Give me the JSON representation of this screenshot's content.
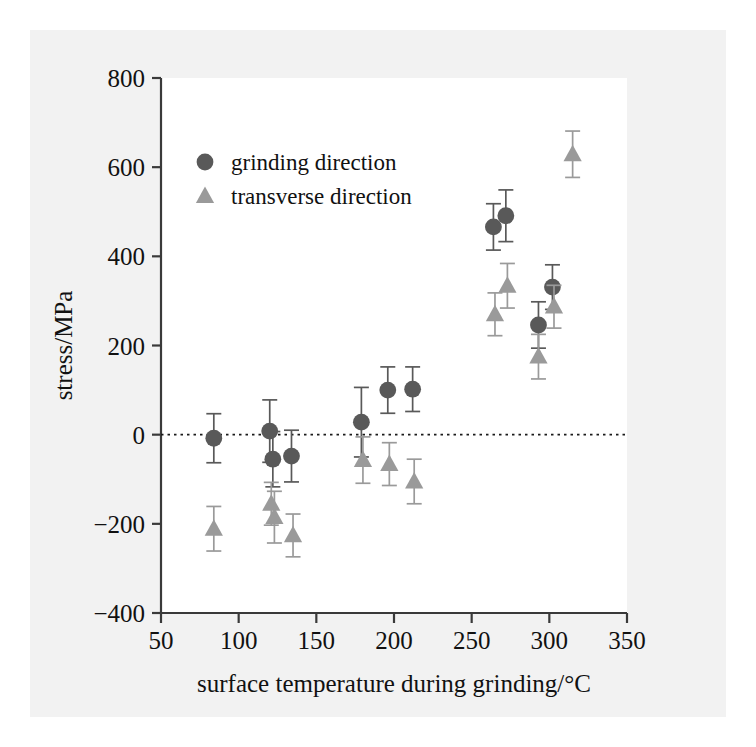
{
  "figure": {
    "background": "#f2f2f2",
    "plot_background": "#ffffff"
  },
  "chart_data": {
    "type": "scatter",
    "title": "",
    "xlabel": "surface temperature during grinding/°C",
    "ylabel": "stress/MPa",
    "xlim": [
      50,
      350
    ],
    "ylim": [
      -400,
      800
    ],
    "xticks": [
      50,
      100,
      150,
      200,
      250,
      300,
      350
    ],
    "yticks": [
      -400,
      -200,
      0,
      200,
      400,
      600,
      800
    ],
    "xtick_labels": [
      "50",
      "100",
      "150",
      "200",
      "250",
      "300",
      "350"
    ],
    "ytick_labels": [
      "−400",
      "−200",
      "0",
      "200",
      "400",
      "600",
      "800"
    ],
    "grid": false,
    "zero_reference_line": {
      "y": 0,
      "style": "dotted",
      "color": "#1a1a1a"
    },
    "legend": {
      "position": "upper left inside",
      "entries": [
        {
          "label": "grinding direction",
          "marker": "circle",
          "color": "#595959"
        },
        {
          "label": "transverse direction",
          "marker": "triangle",
          "color": "#9a9a9a"
        }
      ]
    },
    "series": [
      {
        "name": "grinding direction",
        "marker": "circle",
        "color": "#595959",
        "points": [
          {
            "x": 84,
            "y": -8,
            "yerr": 55
          },
          {
            "x": 120,
            "y": 8,
            "yerr": 70
          },
          {
            "x": 122,
            "y": -55,
            "yerr": 62
          },
          {
            "x": 134,
            "y": -48,
            "yerr": 58
          },
          {
            "x": 179,
            "y": 28,
            "yerr": 78
          },
          {
            "x": 196,
            "y": 100,
            "yerr": 52
          },
          {
            "x": 212,
            "y": 102,
            "yerr": 50
          },
          {
            "x": 264,
            "y": 466,
            "yerr": 52
          },
          {
            "x": 272,
            "y": 491,
            "yerr": 58
          },
          {
            "x": 293,
            "y": 246,
            "yerr": 52
          },
          {
            "x": 302,
            "y": 331,
            "yerr": 50
          }
        ]
      },
      {
        "name": "transverse direction",
        "marker": "triangle",
        "color": "#9a9a9a",
        "points": [
          {
            "x": 84,
            "y": -211,
            "yerr": 50
          },
          {
            "x": 121,
            "y": -155,
            "yerr": 48
          },
          {
            "x": 123,
            "y": -185,
            "yerr": 58
          },
          {
            "x": 135,
            "y": -226,
            "yerr": 48
          },
          {
            "x": 180,
            "y": -57,
            "yerr": 52
          },
          {
            "x": 197,
            "y": -66,
            "yerr": 48
          },
          {
            "x": 213,
            "y": -105,
            "yerr": 50
          },
          {
            "x": 265,
            "y": 270,
            "yerr": 48
          },
          {
            "x": 273,
            "y": 334,
            "yerr": 50
          },
          {
            "x": 293,
            "y": 175,
            "yerr": 50
          },
          {
            "x": 303,
            "y": 287,
            "yerr": 48
          },
          {
            "x": 315,
            "y": 629,
            "yerr": 52
          }
        ]
      }
    ]
  }
}
